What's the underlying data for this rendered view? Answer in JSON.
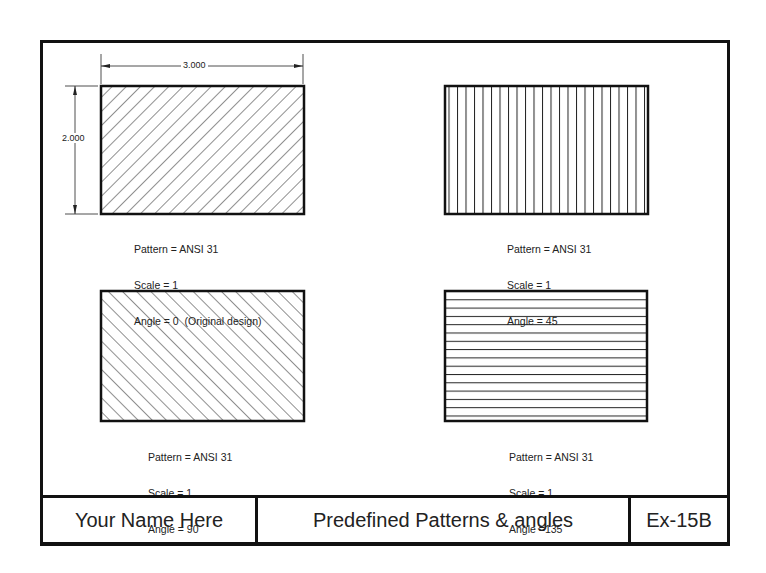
{
  "drawing": {
    "dimensions": {
      "width_label": "3.000",
      "height_label": "2.000"
    },
    "panels": [
      {
        "id": "top-left",
        "pattern_line": "Pattern = ANSI 31",
        "scale_line": "Scale = 1",
        "angle_line": "Angle = 0  (Original design)",
        "hatch": "diagonal-45"
      },
      {
        "id": "top-right",
        "pattern_line": "Pattern = ANSI 31",
        "scale_line": "Scale = 1",
        "angle_line": "Angle = 45",
        "hatch": "vertical"
      },
      {
        "id": "bottom-left",
        "pattern_line": "Pattern = ANSI 31",
        "scale_line": "Scale = 1",
        "angle_line": "Angle = 90",
        "hatch": "diagonal-135"
      },
      {
        "id": "bottom-right",
        "pattern_line": "Pattern = ANSI 31",
        "scale_line": "Scale = 1",
        "angle_line": "Angle =135",
        "hatch": "horizontal"
      }
    ]
  },
  "title_block": {
    "name": "Your Name Here",
    "title": "Predefined Patterns & angles",
    "number": "Ex-15B"
  },
  "colors": {
    "line": "#111111",
    "background": "#ffffff"
  }
}
